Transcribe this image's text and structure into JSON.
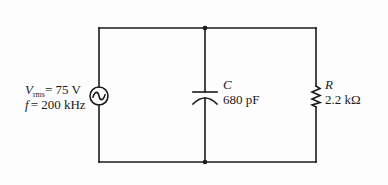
{
  "diagram": {
    "type": "circuit",
    "topology": "parallel",
    "source": {
      "kind": "ac-voltage-source",
      "symbol_var": "V",
      "symbol_sub": "rms",
      "value_text": "= 75  V",
      "freq_var": "f",
      "freq_text": "= 200  kHz"
    },
    "capacitor": {
      "kind": "capacitor",
      "symbol": "C",
      "value": "680  pF"
    },
    "resistor": {
      "kind": "resistor",
      "symbol": "R",
      "value": "2.2  kΩ"
    },
    "colors": {
      "wire": "#1a1a1a",
      "background": "#fdfdfd"
    }
  }
}
